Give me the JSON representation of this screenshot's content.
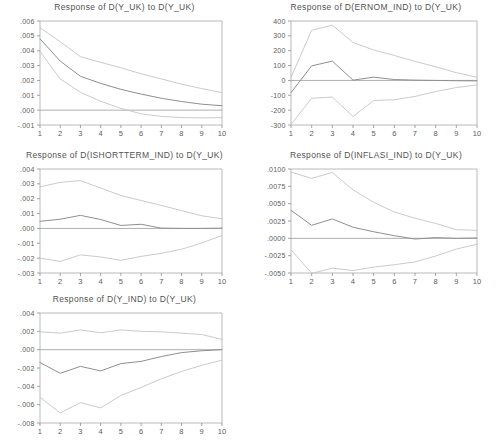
{
  "figure": {
    "name": "impulse-response-panel",
    "background": "#ffffff",
    "axis_color": "#8c8c8c",
    "center_line_color": "#8f8f8f",
    "band_line_color": "#c4c4c4",
    "panel_count": 5
  },
  "chart_data": [
    {
      "id": "response-y-uk-to-y-uk",
      "type": "line",
      "title": "Response of D(Y_UK) to D(Y_UK)",
      "xlabel": "",
      "ylabel": "",
      "x": [
        1,
        2,
        3,
        4,
        5,
        6,
        7,
        8,
        9,
        10
      ],
      "xlim": [
        1,
        10
      ],
      "xticks": [
        "1",
        "2",
        "3",
        "4",
        "5",
        "6",
        "7",
        "8",
        "9",
        "10"
      ],
      "ylim": [
        -0.001,
        0.006
      ],
      "yticks": [
        ".006",
        ".005",
        ".004",
        ".003",
        ".002",
        ".001",
        ".000",
        "-.001"
      ],
      "ytick_values": [
        0.006,
        0.005,
        0.004,
        0.003,
        0.002,
        0.001,
        0.0,
        -0.001
      ],
      "grid": false,
      "legend": "none",
      "zero_line": true,
      "series": [
        {
          "name": "upper-band",
          "style": "band",
          "values": [
            0.00555,
            0.0046,
            0.0036,
            0.00322,
            0.00285,
            0.00245,
            0.0021,
            0.00175,
            0.00145,
            0.00118
          ]
        },
        {
          "name": "impulse-response",
          "style": "center",
          "values": [
            0.0048,
            0.0033,
            0.00228,
            0.0018,
            0.0014,
            0.00108,
            0.0008,
            0.00058,
            0.0004,
            0.0003
          ]
        },
        {
          "name": "lower-band",
          "style": "band",
          "values": [
            0.00395,
            0.0021,
            0.0012,
            0.0006,
            0.00012,
            -0.00025,
            -0.00042,
            -0.0005,
            -0.00052,
            -0.0005
          ]
        }
      ]
    },
    {
      "id": "response-ernom-ind-to-y-uk",
      "type": "line",
      "title": "Response of D(ERNOM_IND) to D(Y_UK)",
      "xlabel": "",
      "ylabel": "",
      "x": [
        1,
        2,
        3,
        4,
        5,
        6,
        7,
        8,
        9,
        10
      ],
      "xlim": [
        1,
        10
      ],
      "xticks": [
        "1",
        "2",
        "3",
        "4",
        "5",
        "6",
        "7",
        "8",
        "9",
        "10"
      ],
      "ylim": [
        -300,
        400
      ],
      "yticks": [
        "400",
        "300",
        "200",
        "100",
        "0",
        "-100",
        "-200",
        "-300"
      ],
      "ytick_values": [
        400,
        300,
        200,
        100,
        0,
        -100,
        -200,
        -300
      ],
      "grid": false,
      "legend": "none",
      "zero_line": true,
      "series": [
        {
          "name": "upper-band",
          "style": "band",
          "values": [
            20,
            338,
            372,
            255,
            205,
            168,
            128,
            92,
            52,
            22
          ]
        },
        {
          "name": "impulse-response",
          "style": "center",
          "values": [
            -82,
            98,
            130,
            2,
            22,
            6,
            2,
            0,
            -2,
            -3
          ]
        },
        {
          "name": "lower-band",
          "style": "band",
          "values": [
            -296,
            -120,
            -112,
            -243,
            -135,
            -130,
            -108,
            -75,
            -48,
            -30
          ]
        }
      ]
    },
    {
      "id": "response-ishortterm-ind-to-y-uk",
      "type": "line",
      "title": "Response of D(ISHORTTERM_IND) to D(Y_UK)",
      "xlabel": "",
      "ylabel": "",
      "x": [
        1,
        2,
        3,
        4,
        5,
        6,
        7,
        8,
        9,
        10
      ],
      "xlim": [
        1,
        10
      ],
      "xticks": [
        "1",
        "2",
        "3",
        "4",
        "5",
        "6",
        "7",
        "8",
        "9",
        "10"
      ],
      "ylim": [
        -0.003,
        0.004
      ],
      "yticks": [
        ".004",
        ".003",
        ".002",
        ".001",
        ".000",
        "-.001",
        "-.002",
        "-.003"
      ],
      "ytick_values": [
        0.004,
        0.003,
        0.002,
        0.001,
        0.0,
        -0.001,
        -0.002,
        -0.003
      ],
      "grid": false,
      "legend": "none",
      "zero_line": true,
      "series": [
        {
          "name": "upper-band",
          "style": "band",
          "values": [
            0.0028,
            0.0031,
            0.00322,
            0.00272,
            0.00222,
            0.00188,
            0.00155,
            0.0012,
            0.00085,
            0.00065
          ]
        },
        {
          "name": "impulse-response",
          "style": "center",
          "values": [
            0.00048,
            0.00062,
            0.00088,
            0.0006,
            0.0002,
            0.00028,
            2e-05,
            0.0,
            0.0,
            2e-05
          ]
        },
        {
          "name": "lower-band",
          "style": "band",
          "values": [
            -0.002,
            -0.00222,
            -0.00178,
            -0.00192,
            -0.00215,
            -0.00188,
            -0.00168,
            -0.0014,
            -0.00098,
            -0.00048
          ]
        }
      ]
    },
    {
      "id": "response-inflasi-ind-to-y-uk",
      "type": "line",
      "title": "Response of D(INFLASI_IND) to D(Y_UK)",
      "xlabel": "",
      "ylabel": "",
      "x": [
        1,
        2,
        3,
        4,
        5,
        6,
        7,
        8,
        9,
        10
      ],
      "xlim": [
        -0.005,
        0.01
      ],
      "xticks": [
        "1",
        "2",
        "3",
        "4",
        "5",
        "6",
        "7",
        "8",
        "9",
        "10"
      ],
      "ylim": [
        -0.005,
        0.01
      ],
      "yticks": [
        ".0100",
        ".0075",
        ".0050",
        ".0025",
        ".0000",
        "-.0025",
        "-.0050"
      ],
      "ytick_values": [
        0.01,
        0.0075,
        0.005,
        0.0025,
        0.0,
        -0.0025,
        -0.005
      ],
      "grid": false,
      "legend": "none",
      "zero_line": true,
      "series": [
        {
          "name": "upper-band",
          "style": "band",
          "values": [
            0.00955,
            0.00865,
            0.0095,
            0.007,
            0.0052,
            0.0038,
            0.0029,
            0.00215,
            0.00125,
            0.00115
          ]
        },
        {
          "name": "impulse-response",
          "style": "center",
          "values": [
            0.00405,
            0.00188,
            0.0028,
            0.0016,
            0.00095,
            0.00038,
            -0.0001,
            0.0001,
            0.0,
            5e-05
          ]
        },
        {
          "name": "lower-band",
          "style": "band",
          "values": [
            -0.00165,
            -0.00505,
            -0.0043,
            -0.00465,
            -0.00415,
            -0.0038,
            -0.0034,
            -0.00255,
            -0.00155,
            -0.00085
          ]
        }
      ]
    },
    {
      "id": "response-y-ind-to-y-uk",
      "type": "line",
      "title": "Response of D(Y_IND) to D(Y_UK)",
      "xlabel": "",
      "ylabel": "",
      "x": [
        1,
        2,
        3,
        4,
        5,
        6,
        7,
        8,
        9,
        10
      ],
      "xlim": [
        1,
        10
      ],
      "xticks": [
        "1",
        "2",
        "3",
        "4",
        "5",
        "6",
        "7",
        "8",
        "9",
        "10"
      ],
      "ylim": [
        -0.008,
        0.004
      ],
      "yticks": [
        ".004",
        ".002",
        ".000",
        "-.002",
        "-.004",
        "-.006",
        "-.008"
      ],
      "ytick_values": [
        0.004,
        0.002,
        0.0,
        -0.002,
        -0.004,
        -0.006,
        -0.008
      ],
      "grid": false,
      "legend": "none",
      "zero_line": true,
      "series": [
        {
          "name": "upper-band",
          "style": "band",
          "values": [
            0.00195,
            0.0018,
            0.00215,
            0.00185,
            0.00215,
            0.002,
            0.00195,
            0.0018,
            0.00165,
            0.00112
          ]
        },
        {
          "name": "impulse-response",
          "style": "center",
          "values": [
            -0.0014,
            -0.00258,
            -0.00182,
            -0.00232,
            -0.00152,
            -0.00128,
            -0.00075,
            -0.00032,
            -0.00012,
            0.0
          ]
        },
        {
          "name": "lower-band",
          "style": "band",
          "values": [
            -0.0052,
            -0.0069,
            -0.00578,
            -0.00635,
            -0.005,
            -0.00412,
            -0.00318,
            -0.00238,
            -0.0017,
            -0.00115
          ]
        }
      ]
    }
  ]
}
